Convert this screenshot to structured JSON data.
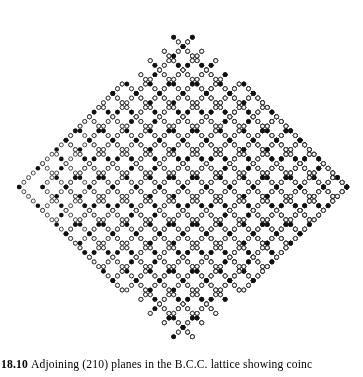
{
  "figure": {
    "number": "18.10",
    "caption": "Adjoining (210) planes in the B.C.C. lattice showing coinc",
    "caption_full_visible": "18.10 Adjoining (210) planes in the B.C.C. lattice showing coinc",
    "alt": "Diamond-shaped array of chevron-shaped chains of small circles; most circles are open (unfilled), a regular sub-lattice of circles is filled solid black."
  },
  "colors": {
    "background": "#ffffff",
    "ink": "#1a1a1a",
    "open_circle_stroke": "#2b2b2b",
    "open_circle_fill": "#ffffff",
    "filled_circle": "#111111"
  },
  "lattice": {
    "type": "chevron-array",
    "description": "Diamond (rhombus) outline built from nested V / chevron chains of small circles",
    "center_x": 183,
    "center_y": 187,
    "half_width": 167,
    "half_height": 162,
    "chevron_count": 15,
    "chevron_pitch_x": 23.4,
    "site_pitch": 5.85,
    "open_radius": 2.0,
    "filled_radius": 2.3,
    "stroke_width": 0.85,
    "filled_period": 4,
    "filled_offset": 0
  },
  "chart_data": {
    "type": "scatter",
    "xlabel": "",
    "ylabel": "",
    "legend": [
      {
        "marker": "open-circle",
        "label": "lattice site in adjoining (210) plane"
      },
      {
        "marker": "filled-circle",
        "label": "coincidence site"
      }
    ],
    "series": [
      {
        "name": "open-sites",
        "marker": "open-circle",
        "count_approx": 980
      },
      {
        "name": "coincidence-sites",
        "marker": "filled-circle",
        "count_approx": 62
      }
    ],
    "grid": false,
    "axis_visible": false
  }
}
